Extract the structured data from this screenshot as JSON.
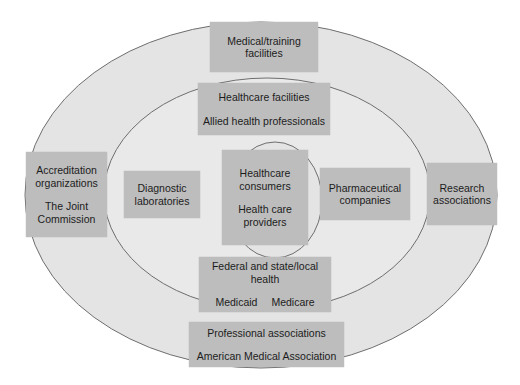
{
  "diagram": {
    "type": "concentric-ellipses",
    "colors": {
      "outer_fill": "#e4e4e4",
      "middle_fill": "#e9e9e9",
      "inner_fill": "#e4e4e4",
      "ring_stroke": "#6e6e6e",
      "box_fill": "#bdbdbd",
      "text": "#1c1c1c"
    },
    "outer_ring": {
      "top": {
        "line1": "Medical/training",
        "line2": "facilities"
      },
      "left": {
        "line1": "Accreditation",
        "line2": "organizations",
        "line3": "The Joint",
        "line4": "Commission"
      },
      "right": {
        "line1": "Research",
        "line2": "associations"
      },
      "bottom": {
        "line1": "Professional associations",
        "line2": "American Medical Association"
      }
    },
    "middle_ring": {
      "top": {
        "line1": "Healthcare facilities",
        "line2": "Allied health professionals"
      },
      "left": {
        "line1": "Diagnostic",
        "line2": "laboratories"
      },
      "right": {
        "line1": "Pharmaceutical",
        "line2": "companies"
      },
      "bottom": {
        "line1": "Federal and state/local",
        "line2": "health",
        "item1": "Medicaid",
        "item2": "Medicare"
      }
    },
    "center": {
      "line1": "Healthcare",
      "line2": "consumers",
      "line3": "Health care",
      "line4": "providers"
    }
  }
}
